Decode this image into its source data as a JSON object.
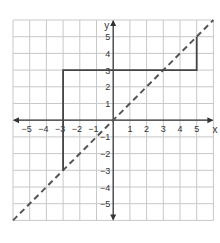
{
  "chart_data": {
    "type": "line",
    "title": "",
    "xlabel": "x",
    "ylabel": "y",
    "xlim": [
      -6,
      6
    ],
    "ylim": [
      -6,
      6
    ],
    "grid": true,
    "x_ticks": [
      -5,
      -4,
      -3,
      -2,
      -1,
      1,
      2,
      3,
      4,
      5
    ],
    "y_ticks": [
      5,
      4,
      3,
      2,
      1,
      -1,
      -2,
      -3,
      -4,
      -5
    ],
    "tick_labels_x": [
      "−5",
      "−4",
      "−3",
      "−2",
      "−1",
      "1",
      "2",
      "3",
      "4",
      "5"
    ],
    "tick_labels_y": [
      "5",
      "4",
      "3",
      "2",
      "1",
      "−1",
      "−2",
      "−3",
      "−4",
      "−5"
    ],
    "series": [
      {
        "name": "y = x",
        "style": "dashed",
        "color": "#555555",
        "points": [
          [
            -6,
            -6
          ],
          [
            6,
            6
          ]
        ]
      },
      {
        "name": "step path",
        "style": "solid",
        "color": "#444444",
        "points": [
          [
            -3,
            -3
          ],
          [
            -3,
            3
          ],
          [
            5,
            3
          ],
          [
            5,
            5
          ]
        ]
      }
    ]
  },
  "axes": {
    "x_label": "x",
    "y_label": "y"
  },
  "colors": {
    "grid": "#c8c8c8",
    "axis": "#333333",
    "label": "#333333"
  }
}
